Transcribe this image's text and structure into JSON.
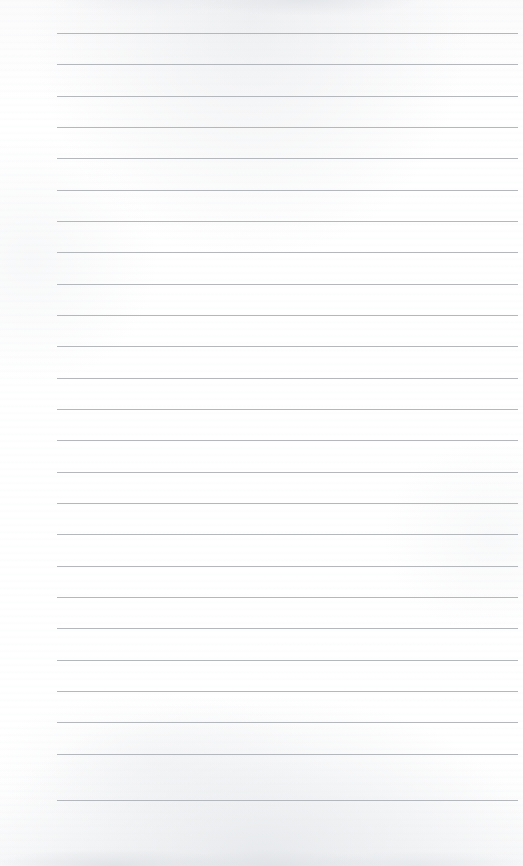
{
  "document": {
    "kind": "scanned-lined-notepad-page",
    "title": "Blank Lined Notepad Page",
    "orientation": "portrait",
    "page_width_px": 523,
    "page_height_px": 866,
    "paper_color": "#fefefe",
    "has_visible_text": false,
    "has_handwriting": false,
    "text_content": ""
  },
  "ruling": {
    "line_color": "#b0b4b9",
    "line_thickness_px": 1,
    "line_count": 25,
    "first_line_y_px": 33,
    "line_spacing_px": 31.3,
    "left_margin_x_px": 57,
    "right_end_x_px": 518,
    "vertical_margin_rule": false,
    "lines_y_px": [
      33,
      64,
      96,
      127,
      158,
      190,
      221,
      252,
      284,
      315,
      346,
      378,
      409,
      440,
      472,
      503,
      534,
      566,
      597,
      628,
      660,
      691,
      722,
      754,
      800
    ]
  },
  "artifacts": {
    "top_edge_shading": "light gray wash across upper edge",
    "bottom_edge_shading": "mottled gray band along bottom edge",
    "grain": "faint horizontal scan banding"
  }
}
